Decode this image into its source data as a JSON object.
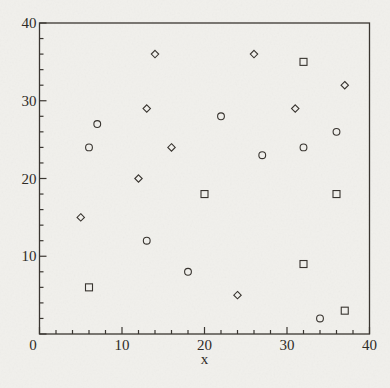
{
  "figure": {
    "background": "#f1f0ec",
    "line_color": "#3a3631",
    "text_color": "#2e2b27",
    "marker_color": "#38342f"
  },
  "chart_data": {
    "type": "scatter",
    "title": "",
    "xlabel": "x",
    "ylabel": "",
    "xlim": [
      0,
      40
    ],
    "ylim": [
      0,
      40
    ],
    "grid": false,
    "legend_position": "none",
    "origin_label": "0",
    "x_tick_values": [
      10,
      20,
      30,
      40
    ],
    "x_tick_labels": [
      "10",
      "20",
      "30",
      "40"
    ],
    "y_tick_values": [
      10,
      20,
      30,
      40
    ],
    "y_tick_labels": [
      "10",
      "20",
      "30",
      "40"
    ],
    "minor_tick_step": 2,
    "series": [
      {
        "name": "diamond-series",
        "marker": "diamond",
        "points": [
          [
            14,
            36
          ],
          [
            26,
            36
          ],
          [
            37,
            32
          ],
          [
            13,
            29
          ],
          [
            31,
            29
          ],
          [
            16,
            24
          ],
          [
            12,
            20
          ],
          [
            5,
            15
          ],
          [
            24,
            5
          ]
        ]
      },
      {
        "name": "circle-series",
        "marker": "circle",
        "points": [
          [
            7,
            27
          ],
          [
            22,
            28
          ],
          [
            6,
            24
          ],
          [
            36,
            26
          ],
          [
            32,
            24
          ],
          [
            27,
            23
          ],
          [
            13,
            12
          ],
          [
            18,
            8
          ],
          [
            34,
            2
          ]
        ]
      },
      {
        "name": "square-series",
        "marker": "square",
        "points": [
          [
            32,
            35
          ],
          [
            20,
            18
          ],
          [
            36,
            18
          ],
          [
            32,
            9
          ],
          [
            6,
            6
          ],
          [
            37,
            3
          ]
        ]
      }
    ]
  }
}
